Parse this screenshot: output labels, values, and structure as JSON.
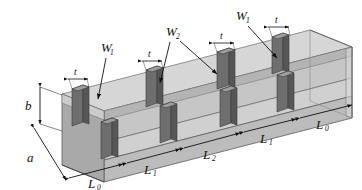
{
  "figure": {
    "type": "technical-diagram",
    "projection": "isometric",
    "render_style": "grayscale shaded"
  },
  "colors": {
    "background": "#ffffff",
    "top_face": "#d6d6d6",
    "inner_floor": "#c8c8c8",
    "front_face": "#bdbdbd",
    "side_face": "#a8a8a8",
    "wall_edge": "#e2e2e2",
    "iris_front": "#6e6e6e",
    "iris_side": "#555555",
    "iris_top": "#9a9a9a",
    "outline": "#4a4a4a",
    "dimension_line": "#111111",
    "label_text": "#111111"
  },
  "dimension_labels": {
    "height": {
      "symbol": "b",
      "subscript": "",
      "description": "waveguide broad-wall height"
    },
    "width": {
      "symbol": "a",
      "subscript": "",
      "description": "waveguide width"
    },
    "thickness": {
      "symbol": "t",
      "subscript": "",
      "description": "iris thickness"
    }
  },
  "iris_labels": [
    {
      "symbol": "W",
      "subscript": "1",
      "x": 93,
      "y": 47
    },
    {
      "symbol": "W",
      "subscript": "2",
      "x": 167,
      "y": 32
    },
    {
      "symbol": "W",
      "subscript": "1",
      "x": 238,
      "y": 16
    }
  ],
  "thickness_labels": [
    {
      "symbol": "t",
      "x": 48,
      "y": 70
    },
    {
      "symbol": "t",
      "x": 128,
      "y": 57
    },
    {
      "symbol": "t",
      "x": 202,
      "y": 41
    },
    {
      "symbol": "t",
      "x": 258,
      "y": 24
    }
  ],
  "cavity_lengths": [
    {
      "symbol": "L",
      "subscript": "0",
      "x": 94,
      "y": 181,
      "label": "L0"
    },
    {
      "symbol": "L",
      "subscript": "1",
      "x": 148,
      "y": 168,
      "label": "L1"
    },
    {
      "symbol": "L",
      "subscript": "2",
      "x": 207,
      "y": 153,
      "label": "L2"
    },
    {
      "symbol": "L",
      "subscript": "1",
      "x": 262,
      "y": 138,
      "label": "L1"
    },
    {
      "symbol": "L",
      "subscript": "0",
      "x": 320,
      "y": 124,
      "label": "L0"
    }
  ],
  "structure": {
    "iris_count": 8,
    "back_wall_iris_count": 4,
    "front_wall_iris_count": 4,
    "arrangement": "alternating inductive irises",
    "symmetry": "symmetric about center",
    "length_sequence": [
      "L0",
      "L1",
      "L2",
      "L1",
      "L0"
    ]
  }
}
